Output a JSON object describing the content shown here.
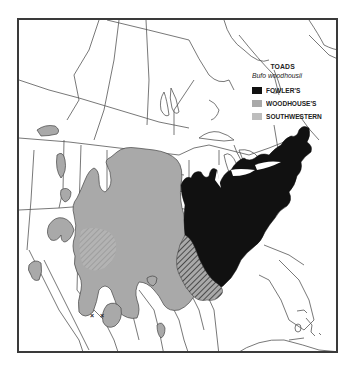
{
  "map": {
    "title": "Range map of toads (Bufo woodhousii) in North America",
    "region": "North America (Canada, United States, Mexico)",
    "markers": [
      {
        "symbol": "×",
        "location": "central Mexico"
      },
      {
        "symbol": "×",
        "location": "central Mexico"
      }
    ]
  },
  "legend": {
    "title": "TOADS",
    "subtitle": "Bufo woodhousii",
    "items": [
      {
        "label": "FOWLER'S",
        "color": "#111111",
        "pattern": "solid"
      },
      {
        "label": "WOODHOUSE'S",
        "color": "#a9a9a9",
        "pattern": "solid"
      },
      {
        "label": "SOUTHWESTERN",
        "color": "#bdbdbd",
        "pattern": "solid"
      }
    ]
  },
  "colors": {
    "fowlers": "#111111",
    "woodhouses": "#a9a9a9",
    "southwestern": "#bdbdbd",
    "hatch": "#444444",
    "border": "#3a3a3a",
    "lines": "#555555"
  }
}
